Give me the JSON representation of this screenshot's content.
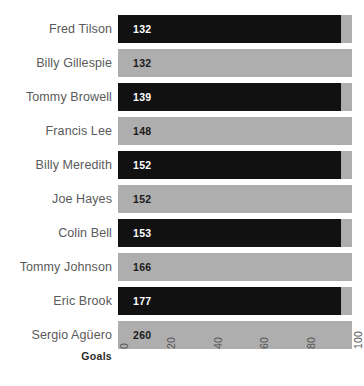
{
  "chart_data": {
    "type": "bar",
    "orientation": "horizontal",
    "title": "",
    "subtitle": "",
    "xlabel": "Goals",
    "ylabel": "",
    "categories": [
      "Fred Tilson",
      "Billy Gillespie",
      "Tommy Browell",
      "Francis Lee",
      "Billy Meredith",
      "Joe Hayes",
      "Colin Bell",
      "Tommy Johnson",
      "Eric Brook",
      "Sergio Agüero"
    ],
    "values": [
      132,
      132,
      139,
      148,
      152,
      152,
      153,
      166,
      177,
      260
    ],
    "value_labels": [
      "132",
      "132",
      "139",
      "148",
      "152",
      "152",
      "153",
      "166",
      "177",
      "260"
    ],
    "bar_colors": [
      "#111111",
      "#aeaeae",
      "#111111",
      "#aeaeae",
      "#111111",
      "#aeaeae",
      "#111111",
      "#aeaeae",
      "#111111",
      "#aeaeae"
    ],
    "xticks": [
      0,
      20,
      40,
      60,
      80,
      100
    ],
    "xtick_labels": [
      "0",
      "20",
      "40",
      "60",
      "80",
      "100"
    ],
    "xlim": [
      0,
      100
    ],
    "grid": false,
    "legend": false,
    "tick_label_rotation": -90,
    "background_color": "#ffffff",
    "label_text_color": "#5a5a5a",
    "value_on_dark_color": "#ffffff",
    "value_on_light_color": "#1b1b1b",
    "note": "all bars are clipped at the axis maximum of 100; dark bars render a lighter overflow cap at the right edge"
  },
  "layout": {
    "plot_left_px": 118,
    "plot_right_px": 352,
    "dark_bar_end_px": 341,
    "row_height_px": 34,
    "bar_height_px": 28,
    "first_row_top_px": 12
  }
}
